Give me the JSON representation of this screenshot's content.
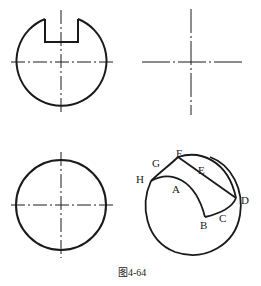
{
  "figure": {
    "caption": "图4-64",
    "views": [
      {
        "name": "front-view-with-slot",
        "shape": "circle with rectangular slot at top"
      },
      {
        "name": "side-view-centerlines",
        "shape": "crossed center lines only"
      },
      {
        "name": "top-view-circle",
        "shape": "circle with center lines"
      },
      {
        "name": "isometric-sketch",
        "shape": "sphere with cut surface"
      }
    ],
    "labels": {
      "A": "A",
      "B": "B",
      "C": "C",
      "D": "D",
      "E": "E",
      "F": "F",
      "G": "G",
      "H": "H"
    }
  },
  "colors": {
    "stroke": "#1a1a1a",
    "background": "#ffffff"
  }
}
